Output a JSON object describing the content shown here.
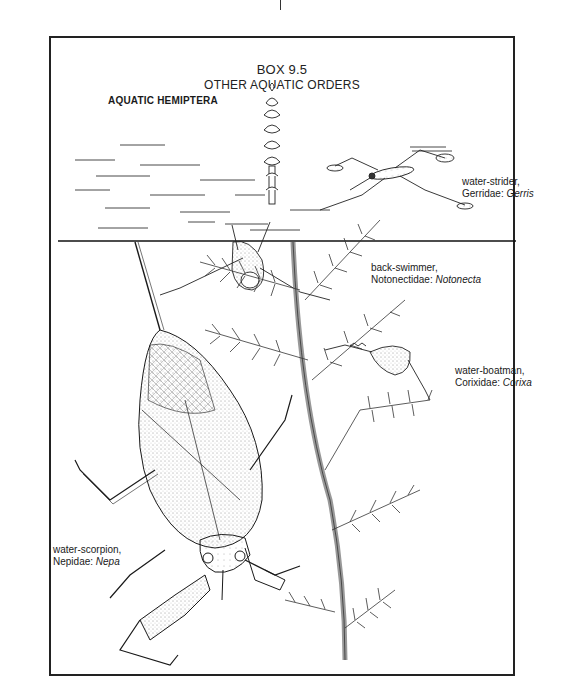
{
  "figure": {
    "box_number": "BOX 9.5",
    "box_title": "OTHER AQUATIC ORDERS",
    "section_heading": "AQUATIC HEMIPTERA",
    "specimens": [
      {
        "common_name": "water-strider,",
        "family": "Gerridae:",
        "genus": "Gerris",
        "position": "above water surface, right"
      },
      {
        "common_name": "back-swimmer,",
        "family": "Notonectidae:",
        "genus": "Notonecta",
        "position": "hanging below surface, center"
      },
      {
        "common_name": "water-boatman,",
        "family": "Corixidae:",
        "genus": "Corixa",
        "position": "on water plant, right middle"
      },
      {
        "common_name": "water-scorpion,",
        "family": "Nepidae:",
        "genus": "Nepa",
        "position": "large, lower left"
      }
    ],
    "style": {
      "ink_color": "#1a1a1a",
      "paper_color": "#ffffff",
      "rendering": "stippled pen-and-ink illustration"
    }
  }
}
